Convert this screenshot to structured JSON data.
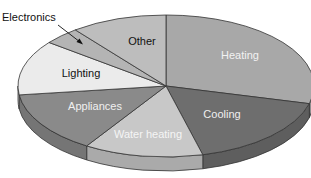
{
  "chart_data": {
    "type": "pie",
    "style": "3d-exploded-none",
    "title": "",
    "categories": [
      "Heating",
      "Cooling",
      "Water heating",
      "Appliances",
      "Lighting",
      "Electronics",
      "Other"
    ],
    "values": [
      29,
      17,
      13,
      14,
      12.5,
      4,
      10.5
    ],
    "value_unit": "percent (estimated from slice angles; no numeric labels shown)",
    "colors": {
      "Heating": "#a8a8a8",
      "Cooling": "#6e6e6e",
      "Water heating": "#c8c8c8",
      "Appliances": "#8a8a8a",
      "Lighting": "#ebebeb",
      "Electronics": "#b4b4b4",
      "Other": "#bdbdbd"
    },
    "label_colors": {
      "Heating": "#f2f2f2",
      "Cooling": "#f0f0f0",
      "Water heating": "#f5f5f5",
      "Appliances": "#f0f0f0",
      "Lighting": "#111111",
      "Electronics": "#111111",
      "Other": "#111111"
    },
    "annotations": [
      {
        "text": "Electronics",
        "type": "callout-arrow",
        "target": "Electronics"
      }
    ],
    "legend": "none",
    "start_angle_deg": -90,
    "direction": "clockwise"
  }
}
